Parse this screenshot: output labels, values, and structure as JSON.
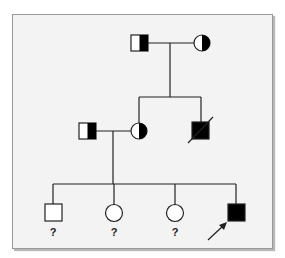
{
  "diagram": {
    "type": "pedigree",
    "colors": {
      "background": "#f3f3f3",
      "symbol_fill": "#000000",
      "symbol_empty": "#ffffff",
      "line": "#222222"
    },
    "generation_I": [
      {
        "id": "I-1",
        "sex": "male",
        "status": "carrier (half-shaded right)"
      },
      {
        "id": "I-2",
        "sex": "female",
        "status": "carrier (half-shaded right)"
      }
    ],
    "generation_II": [
      {
        "id": "II-1",
        "sex": "male",
        "status": "carrier (half-shaded right)",
        "note": "married in"
      },
      {
        "id": "II-2",
        "sex": "female",
        "status": "carrier (half-shaded right)"
      },
      {
        "id": "II-3",
        "sex": "male",
        "status": "affected, deceased"
      }
    ],
    "generation_III": [
      {
        "id": "III-1",
        "sex": "male",
        "status": "unknown",
        "label": "?"
      },
      {
        "id": "III-2",
        "sex": "female",
        "status": "unknown",
        "label": "?"
      },
      {
        "id": "III-3",
        "sex": "female",
        "status": "unknown",
        "label": "?"
      },
      {
        "id": "III-4",
        "sex": "male",
        "status": "affected",
        "proband": true
      }
    ]
  }
}
